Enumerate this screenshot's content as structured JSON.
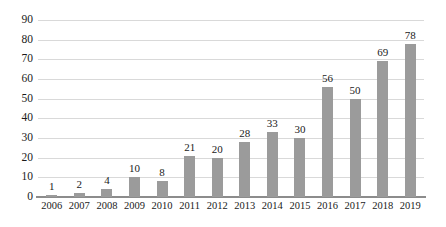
{
  "chart_data": {
    "type": "bar",
    "title": "",
    "subtitle": "",
    "xlabel": "",
    "ylabel": "",
    "categories": [
      "2006",
      "2007",
      "2008",
      "2009",
      "2010",
      "2011",
      "2012",
      "2013",
      "2014",
      "2015",
      "2016",
      "2017",
      "2018",
      "2019"
    ],
    "values": [
      1,
      2,
      4,
      10,
      8,
      21,
      20,
      28,
      33,
      30,
      56,
      50,
      69,
      78
    ],
    "data_labels": [
      "1",
      "2",
      "4",
      "10",
      "8",
      "21",
      "20",
      "28",
      "33",
      "30",
      "56",
      "50",
      "69",
      "78"
    ],
    "ylim": [
      0,
      90
    ],
    "ytick_labels": [
      "0",
      "10",
      "20",
      "30",
      "40",
      "50",
      "60",
      "70",
      "80",
      "90"
    ],
    "ytick_values": [
      0,
      10,
      20,
      30,
      40,
      50,
      60,
      70,
      80,
      90
    ],
    "grid": true,
    "grid_axis": "y",
    "legend": false,
    "legend_position": "none",
    "series": [
      {
        "name": "",
        "values": [
          1,
          2,
          4,
          10,
          8,
          21,
          20,
          28,
          33,
          30,
          56,
          50,
          69,
          78
        ]
      }
    ],
    "colors": {
      "bar": "#9b9b9b",
      "gridline": "#d9d9d9",
      "axis": "#8c8c8c",
      "text": "#1a1a1a",
      "background": "#ffffff"
    }
  }
}
